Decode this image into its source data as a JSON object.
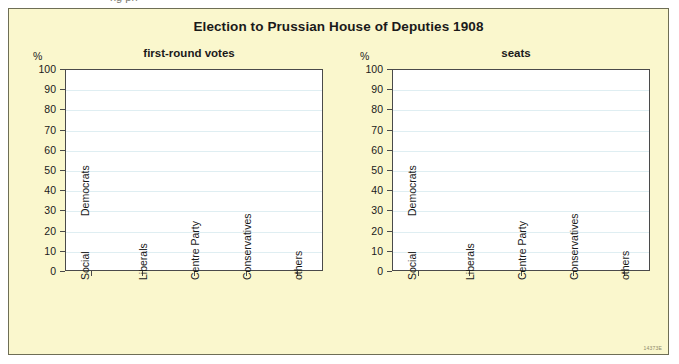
{
  "top_sliver": {
    "text": "ng ph"
  },
  "figure": {
    "title": "Election to Prussian House of Deputies 1908",
    "plate_code": "14373E",
    "panel_color": "#faf7cd",
    "plot_color": "#ffffff",
    "gridline_color": "#dfeef2",
    "axis_color": "#4a4a4a",
    "text_color": "#1a1a1a"
  },
  "chart_data": [
    {
      "type": "bar",
      "title": "first-round votes",
      "xlabel": "",
      "ylabel": "%",
      "ylim": [
        0,
        100
      ],
      "yticks": [
        0,
        10,
        20,
        30,
        40,
        50,
        60,
        70,
        80,
        90,
        100
      ],
      "grid": true,
      "legend": "none",
      "categories": [
        "Social Democrats",
        "Liberals",
        "Centre Party",
        "Conservatives",
        "others"
      ],
      "category_lines": [
        [
          "Social",
          "Democrats"
        ],
        [
          "Liberals"
        ],
        [
          "Centre Party"
        ],
        [
          "Conservatives"
        ],
        [
          "others"
        ]
      ],
      "values": [
        null,
        null,
        null,
        null,
        null
      ]
    },
    {
      "type": "bar",
      "title": "seats",
      "xlabel": "",
      "ylabel": "%",
      "ylim": [
        0,
        100
      ],
      "yticks": [
        0,
        10,
        20,
        30,
        40,
        50,
        60,
        70,
        80,
        90,
        100
      ],
      "grid": true,
      "legend": "none",
      "categories": [
        "Social Democrats",
        "Liberals",
        "Centre Party",
        "Conservatives",
        "others"
      ],
      "category_lines": [
        [
          "Social",
          "Democrats"
        ],
        [
          "Liberals"
        ],
        [
          "Centre Party"
        ],
        [
          "Conservatives"
        ],
        [
          "others"
        ]
      ],
      "values": [
        null,
        null,
        null,
        null,
        null
      ]
    }
  ]
}
